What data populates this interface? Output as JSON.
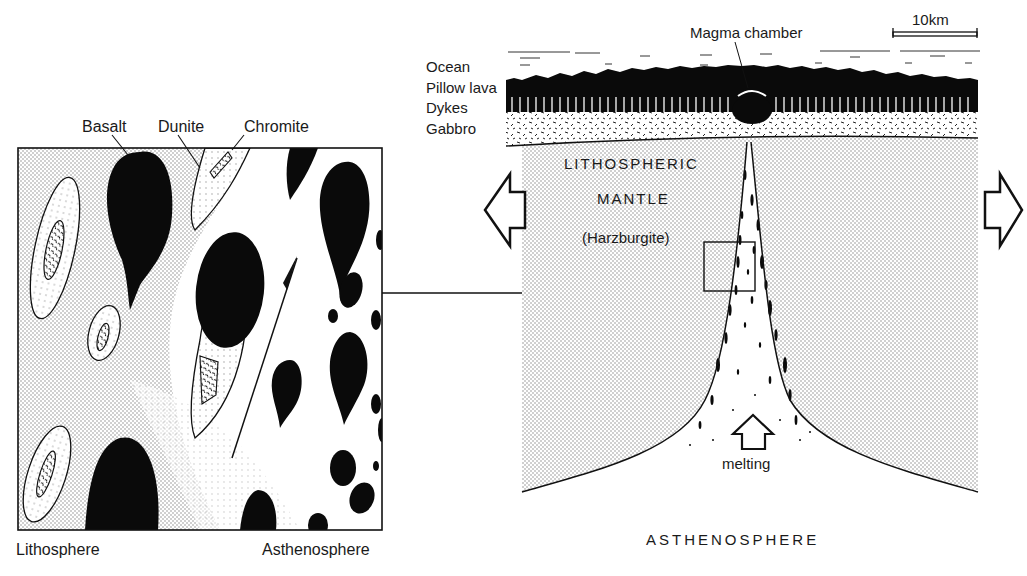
{
  "diagram": {
    "type": "geological-cross-section",
    "left_panel": {
      "title_labels": [
        "Basalt",
        "Dunite",
        "Chromite"
      ],
      "bottom_labels": {
        "left": "Lithosphere",
        "right": "Asthenosphere"
      }
    },
    "right_panel": {
      "scale_bar": "10km",
      "magma_chamber_label": "Magma chamber",
      "layer_labels": [
        "Ocean",
        "Pillow lava",
        "Dykes",
        "Gabbro"
      ],
      "mantle_labels": [
        "LITHOSPHERIC",
        "MANTLE",
        "(Harzburgite)"
      ],
      "melting_label": "melting",
      "asthenosphere_label": "ASTHENOSPHERE"
    },
    "colors": {
      "ink": "#111111",
      "paper": "#ffffff",
      "stipple": "#c8c8c8"
    }
  }
}
